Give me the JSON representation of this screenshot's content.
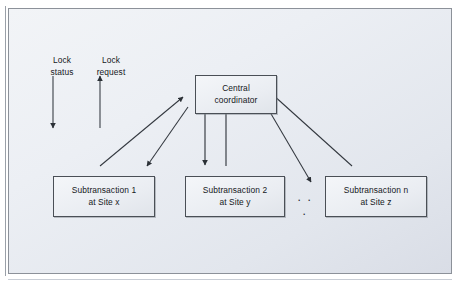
{
  "figure": {
    "type": "diagram",
    "subtype": "centralized-two-phase-locking",
    "colors": {
      "panel_background_light": "#f2f4f7",
      "panel_background_dark": "#d9dde6",
      "panel_border": "#8c9199",
      "box_fill": "#eaedf2",
      "box_border": "#4a4f56",
      "line": "#33383f",
      "text": "#15181c"
    }
  },
  "nodes": {
    "coordinator": {
      "line1": "Central",
      "line2": "coordinator"
    },
    "sub1": {
      "line1": "Subtransaction 1",
      "line2": "at Site x"
    },
    "sub2": {
      "line1": "Subtransaction 2",
      "line2": "at Site y"
    },
    "sub3": {
      "line1": "Subtransaction n",
      "line2": "at Site z"
    }
  },
  "annotations": {
    "lock_status": {
      "line1": "Lock",
      "line2": "status",
      "direction": "down"
    },
    "lock_request": {
      "line1": "Lock",
      "line2": "request",
      "direction": "up"
    },
    "ellipsis": ". . ."
  },
  "edges": [
    {
      "from": "sub1",
      "to": "coordinator",
      "label": "lock request",
      "direction": "up-right"
    },
    {
      "from": "coordinator",
      "to": "sub1",
      "label": "lock status",
      "direction": "down-left"
    },
    {
      "from": "coordinator",
      "to": "sub2",
      "label": "lock status",
      "direction": "down"
    },
    {
      "from": "sub2",
      "to": "coordinator",
      "label": "lock request",
      "direction": "up"
    },
    {
      "from": "sub3",
      "to": "coordinator",
      "label": "lock request",
      "direction": "up-left"
    },
    {
      "from": "coordinator",
      "to": "sub3",
      "label": "lock status",
      "direction": "down-right"
    }
  ]
}
